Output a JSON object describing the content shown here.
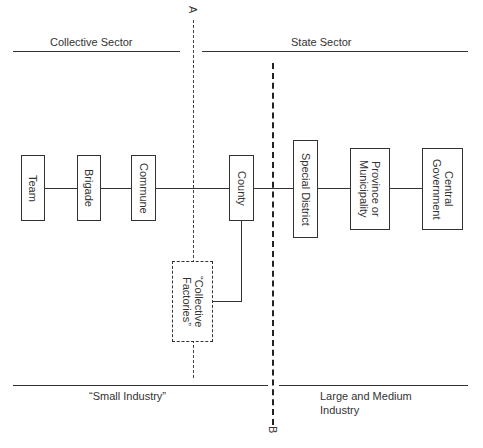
{
  "sectors": {
    "top_left": "Collective Sector",
    "top_right": "State Sector",
    "bottom_left": "“Small Industry”",
    "bottom_right_line1": "Large and Medium",
    "bottom_right_line2": "Industry"
  },
  "dividers": {
    "a_label": "A",
    "b_label": "B"
  },
  "nodes": [
    {
      "id": "team",
      "label": "Team"
    },
    {
      "id": "brigade",
      "label": "Brigade"
    },
    {
      "id": "commune",
      "label": "Commune"
    },
    {
      "id": "county",
      "label": "County"
    },
    {
      "id": "special-district",
      "label": "Special District"
    },
    {
      "id": "province",
      "label": "Province or\nMunicipality"
    },
    {
      "id": "central",
      "label": "Central\nGovernment"
    },
    {
      "id": "collective-factories",
      "label": "“Collective\nFactories”"
    }
  ]
}
